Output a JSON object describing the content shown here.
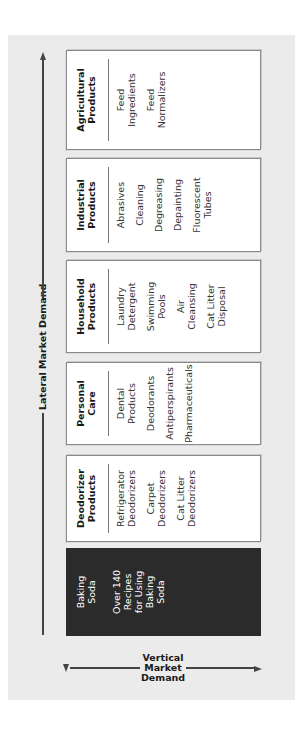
{
  "diagram": {
    "lateral_axis_label": "Lateral Market Demand",
    "vertical_axis_label": "Vertical\nMarket\nDemand",
    "colors": {
      "panel_background": "#ebebeb",
      "box_background": "#ffffff",
      "core_box_background": "#2b2b2b",
      "arrow": "#444444"
    },
    "boxes": [
      {
        "header": "Baking\nSoda",
        "items": [
          "Over 140\nRecipes\nfor Using\nBaking\nSoda"
        ]
      },
      {
        "header": "Deodorizer\nProducts",
        "items": [
          "Refrigerator\nDeodorizers",
          "Carpet\nDeodorizers",
          "Cat Litter\nDeodorizers"
        ]
      },
      {
        "header": "Personal\nCare",
        "items": [
          "Dental\nProducts",
          "Deodorants",
          "Antiperspirants",
          "Pharmaceuticals"
        ]
      },
      {
        "header": "Household\nProducts",
        "items": [
          "Laundry\nDetergent",
          "Swimming\nPools",
          "Air\nCleansing",
          "Cat Litter\nDisposal"
        ]
      },
      {
        "header": "Industrial\nProducts",
        "items": [
          "Abrasives",
          "Cleaning",
          "Degreasing",
          "Depainting",
          "Fluorescent\nTubes"
        ]
      },
      {
        "header": "Agricultural\nProducts",
        "items": [
          "Feed\nIngredients",
          "Feed\nNormalizers"
        ]
      }
    ]
  }
}
